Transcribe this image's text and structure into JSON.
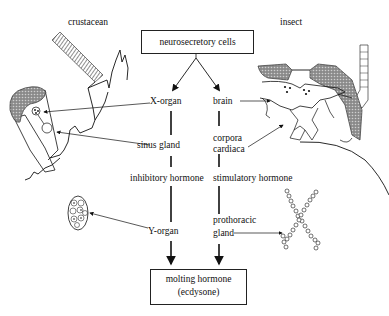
{
  "diagram": {
    "organisms": {
      "left": "crustacean",
      "right": "insect"
    },
    "top_node": "neurosecretory cells",
    "crustacean_pathway": {
      "organ": "X-organ",
      "storage": "sinus gland",
      "hormone": "inhibitory hormone",
      "gland": "Y-organ"
    },
    "insect_pathway": {
      "organ": "brain",
      "storage_line1": "corpora",
      "storage_line2": "cardiaca",
      "hormone": "stimulatory hormone",
      "gland_line1": "prothoracic",
      "gland_line2": "gland"
    },
    "bottom_node": {
      "line1": "molting hormone",
      "line2": "(ecdysone)"
    }
  },
  "colors": {
    "line": "#111111",
    "shade": "#777777"
  }
}
